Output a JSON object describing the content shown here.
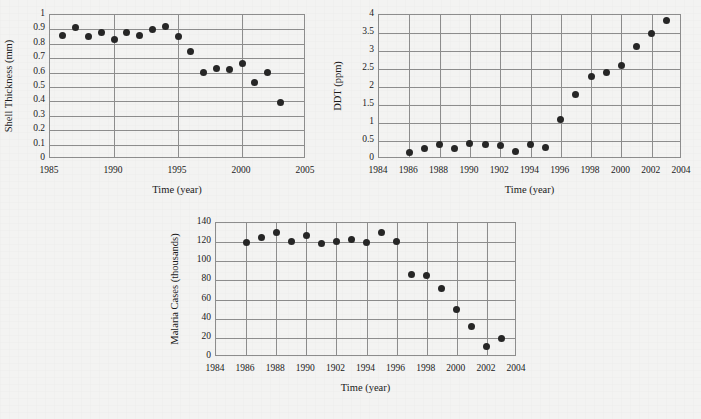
{
  "figure": {
    "background_color": "#f3f3f2",
    "axis_color": "#8d8d8d",
    "marker_color": "#262626"
  },
  "chart_data": [
    {
      "id": "shell-thickness",
      "type": "scatter",
      "title": "",
      "xlabel": "Time (year)",
      "ylabel": "Shell Thickness (mm)",
      "xlim": [
        1985,
        2005
      ],
      "ylim": [
        0,
        1
      ],
      "xticks": [
        "1985",
        "1990",
        "1995",
        "2000",
        "2005"
      ],
      "xtick_values": [
        1985,
        1990,
        1995,
        2000,
        2005
      ],
      "yticks": [
        "0",
        "0.1",
        "0.2",
        "0.3",
        "0.4",
        "0.5",
        "0.6",
        "0.7",
        "0.8",
        "0.9",
        "1"
      ],
      "ytick_values": [
        0,
        0.1,
        0.2,
        0.3,
        0.4,
        0.5,
        0.6,
        0.7,
        0.8,
        0.9,
        1
      ],
      "grid": "horizontal-and-vertical",
      "legend": "none",
      "x": [
        1986,
        1987,
        1988,
        1989,
        1990,
        1991,
        1992,
        1993,
        1994,
        1995,
        1996,
        1997,
        1998,
        1999,
        2000,
        2001,
        2002,
        2003
      ],
      "values": [
        0.86,
        0.91,
        0.85,
        0.88,
        0.83,
        0.88,
        0.86,
        0.9,
        0.92,
        0.85,
        0.75,
        0.6,
        0.63,
        0.62,
        0.66,
        0.53,
        0.6,
        0.39
      ]
    },
    {
      "id": "ddt",
      "type": "scatter",
      "title": "",
      "xlabel": "Time (year)",
      "ylabel": "DDT (ppm)",
      "xlim": [
        1984,
        2004
      ],
      "ylim": [
        0,
        4
      ],
      "xticks": [
        "1984",
        "1986",
        "1988",
        "1990",
        "1902",
        "1994",
        "1996",
        "1998",
        "2000",
        "2002",
        "2004"
      ],
      "xtick_values": [
        1984,
        1986,
        1988,
        1990,
        1992,
        1994,
        1996,
        1998,
        2000,
        2002,
        2004
      ],
      "yticks": [
        "0",
        "0.5",
        "1",
        "1.5",
        "2",
        "2.5",
        "3",
        "3.5",
        "4"
      ],
      "ytick_values": [
        0,
        0.5,
        1,
        1.5,
        2,
        2.5,
        3,
        3.5,
        4
      ],
      "grid": "horizontal-and-vertical",
      "legend": "none",
      "x": [
        1986,
        1987,
        1988,
        1989,
        1990,
        1991,
        1992,
        1993,
        1994,
        1995,
        1996,
        1997,
        1998,
        1999,
        2000,
        2001,
        2002,
        2003
      ],
      "values": [
        0.18,
        0.3,
        0.4,
        0.3,
        0.44,
        0.4,
        0.38,
        0.2,
        0.4,
        0.31,
        1.09,
        1.79,
        2.3,
        2.4,
        2.6,
        3.12,
        3.5,
        3.85
      ]
    },
    {
      "id": "malaria-cases",
      "type": "scatter",
      "title": "",
      "xlabel": "Time (year)",
      "ylabel": "Malaria Cases (thousands)",
      "xlim": [
        1984,
        2004
      ],
      "ylim": [
        0,
        140
      ],
      "xticks": [
        "1984",
        "1986",
        "1988",
        "1990",
        "1902",
        "1994",
        "1996",
        "1998",
        "2000",
        "2002",
        "2004"
      ],
      "xtick_values": [
        1984,
        1986,
        1988,
        1990,
        1992,
        1994,
        1996,
        1998,
        2000,
        2002,
        2004
      ],
      "yticks": [
        "0",
        "20",
        "40",
        "60",
        "80",
        "100",
        "120",
        "140"
      ],
      "ytick_values": [
        0,
        20,
        40,
        60,
        80,
        100,
        120,
        140
      ],
      "grid": "horizontal-and-vertical",
      "legend": "none",
      "x": [
        1986,
        1987,
        1988,
        1989,
        1990,
        1991,
        1992,
        1993,
        1994,
        1995,
        1996,
        1997,
        1998,
        1999,
        2000,
        2001,
        2002,
        2003
      ],
      "values": [
        120,
        125,
        130,
        121,
        127,
        119,
        121,
        123,
        120,
        130,
        121,
        86,
        85,
        72,
        50,
        32,
        11,
        19
      ]
    }
  ]
}
